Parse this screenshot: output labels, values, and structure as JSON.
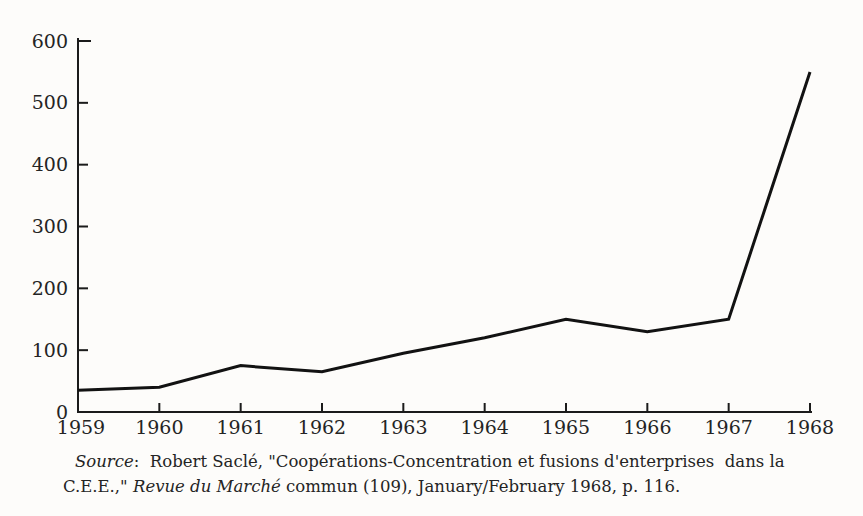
{
  "chart_data": {
    "type": "line",
    "title": "",
    "categories": [
      "1959",
      "1960",
      "1961",
      "1962",
      "1963",
      "1964",
      "1965",
      "1966",
      "1967",
      "1968"
    ],
    "values": [
      35,
      40,
      75,
      65,
      95,
      120,
      150,
      130,
      150,
      550
    ],
    "xlabel": "",
    "ylabel": "",
    "ylim": [
      0,
      600
    ],
    "y_ticks": [
      0,
      100,
      200,
      300,
      400,
      500,
      600
    ],
    "grid": false,
    "legend": "none",
    "line_color": "#121212",
    "line_width": 3
  },
  "caption": {
    "source_label": "Source",
    "line1_rest": ":  Robert Saclé, \"Coopérations-Concentration et fusions d'enterprises  dans la",
    "line2_start": "C.E.E.,\" ",
    "journal": "Revue du Marché",
    "line2_rest": " commun (109), January/February 1968, p. 116."
  },
  "colors": {
    "background": "#fdfcfa",
    "axis": "#1b1b1b",
    "text": "#242424"
  }
}
